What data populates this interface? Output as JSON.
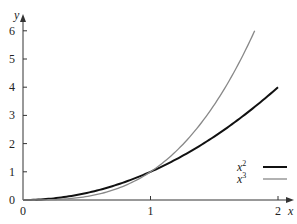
{
  "chart_data": {
    "type": "line",
    "title": "",
    "xlabel": "x",
    "ylabel": "y",
    "xlim": [
      0,
      2
    ],
    "ylim": [
      0,
      6
    ],
    "x_ticks": [
      "0",
      "1",
      "2"
    ],
    "y_ticks": [
      "0",
      "1",
      "2",
      "3",
      "4",
      "5",
      "6"
    ],
    "grid": false,
    "legend_position": "lower-right",
    "series": [
      {
        "name": "x^2",
        "label_base": "x",
        "label_exp": "2",
        "color": "#111111",
        "width": 2.0,
        "x": [
          0,
          0.25,
          0.5,
          0.75,
          1,
          1.25,
          1.5,
          1.75,
          2
        ],
        "y": [
          0,
          0.0625,
          0.25,
          0.5625,
          1,
          1.5625,
          2.25,
          3.0625,
          4
        ]
      },
      {
        "name": "x^3",
        "label_base": "x",
        "label_exp": "3",
        "color": "#888888",
        "width": 1.3,
        "x": [
          0,
          0.25,
          0.5,
          0.75,
          1,
          1.25,
          1.5,
          1.75,
          1.817
        ],
        "y": [
          0,
          0.0156,
          0.125,
          0.4219,
          1,
          1.9531,
          3.375,
          5.3594,
          6
        ]
      }
    ]
  }
}
